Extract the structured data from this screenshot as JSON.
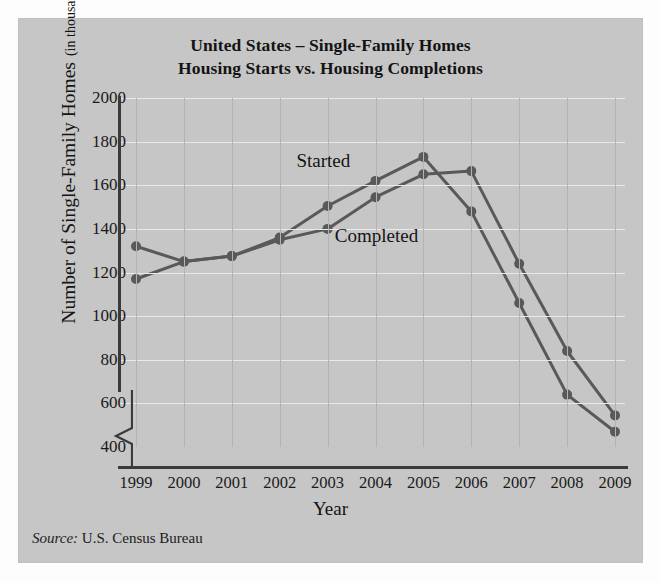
{
  "figure": {
    "title_line1": "United States – Single-Family Homes",
    "title_line2": "Housing Starts vs. Housing Completions",
    "source_label": "Source:",
    "source_text": "U.S. Census Bureau",
    "panel_color": "#c6c6c6",
    "line_color": "#595959",
    "grid_color": "#e9e9e9",
    "axis_color": "#3a3a3a"
  },
  "axis_titles": {
    "x": "Year",
    "y_main": "Number of Single-Family Homes",
    "y_sub": "(in thousands)"
  },
  "chart_data": {
    "type": "line",
    "title": "United States – Single-Family Homes Housing Starts vs. Housing Completions",
    "xlabel": "Year",
    "ylabel": "Number of Single-Family Homes (in thousands)",
    "categories": [
      "1999",
      "2000",
      "2001",
      "2002",
      "2003",
      "2004",
      "2005",
      "2006",
      "2007",
      "2008",
      "2009"
    ],
    "x": [
      1999,
      2000,
      2001,
      2002,
      2003,
      2004,
      2005,
      2006,
      2007,
      2008,
      2009
    ],
    "ylim": [
      400,
      2000
    ],
    "yticks": [
      400,
      600,
      800,
      1000,
      1200,
      1400,
      1600,
      1800,
      2000
    ],
    "grid": true,
    "axis_break_y": true,
    "legend": "inline-labels",
    "series": [
      {
        "name": "Started",
        "label_x": 1999,
        "values": [
          1170,
          1250,
          1275,
          1360,
          1505,
          1620,
          1730,
          1480,
          1060,
          640,
          470
        ]
      },
      {
        "name": "Completed",
        "label_x": 1999,
        "values": [
          1320,
          1250,
          1275,
          1350,
          1400,
          1545,
          1650,
          1665,
          1240,
          840,
          545
        ]
      }
    ],
    "annotations": [
      {
        "text": "Started",
        "x": 2002.35,
        "y": 1700
      },
      {
        "text": "Completed",
        "x": 2003.15,
        "y": 1360
      }
    ]
  }
}
